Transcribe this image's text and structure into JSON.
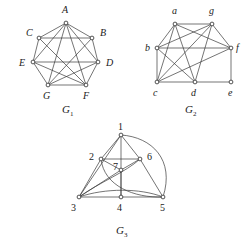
{
  "figure": {
    "background_color": "#ffffff",
    "edge_color": "#3a3a3a",
    "vertex_fill": "#ffffff",
    "vertex_stroke": "#2a2a2a"
  },
  "graphs": [
    {
      "id": "g1",
      "caption_letter": "G",
      "caption_subscript": "1",
      "caption_x": 62,
      "caption_y": 110,
      "label_style": "italic-letters",
      "vertices": [
        {
          "name": "A",
          "x": 66,
          "y": 23,
          "label_x": 62,
          "label_y": 13
        },
        {
          "name": "B",
          "x": 92,
          "y": 38,
          "label_x": 100,
          "label_y": 36
        },
        {
          "name": "C",
          "x": 39,
          "y": 38,
          "label_x": 26,
          "label_y": 36
        },
        {
          "name": "D",
          "x": 98,
          "y": 62,
          "label_x": 106,
          "label_y": 66
        },
        {
          "name": "E",
          "x": 33,
          "y": 62,
          "label_x": 20,
          "label_y": 66
        },
        {
          "name": "F",
          "x": 86,
          "y": 85,
          "label_x": 84,
          "label_y": 99
        },
        {
          "name": "G",
          "x": 48,
          "y": 85,
          "label_x": 43,
          "label_y": 99
        }
      ],
      "edges": [
        [
          "A",
          "B"
        ],
        [
          "A",
          "C"
        ],
        [
          "A",
          "D"
        ],
        [
          "A",
          "E"
        ],
        [
          "A",
          "F"
        ],
        [
          "A",
          "G"
        ],
        [
          "B",
          "C"
        ],
        [
          "B",
          "D"
        ],
        [
          "B",
          "G"
        ],
        [
          "C",
          "E"
        ],
        [
          "C",
          "F"
        ],
        [
          "D",
          "E"
        ],
        [
          "D",
          "F"
        ],
        [
          "D",
          "G"
        ],
        [
          "E",
          "G"
        ],
        [
          "E",
          "F"
        ],
        [
          "F",
          "G"
        ]
      ]
    },
    {
      "id": "g2",
      "caption_letter": "G",
      "caption_subscript": "2",
      "caption_x": 185,
      "caption_y": 110,
      "label_style": "italic-letters",
      "vertices": [
        {
          "name": "a",
          "x": 175,
          "y": 24,
          "label_x": 171,
          "label_y": 13
        },
        {
          "name": "g",
          "x": 212,
          "y": 24,
          "label_x": 209,
          "label_y": 13
        },
        {
          "name": "b",
          "x": 157,
          "y": 48,
          "label_x": 145,
          "label_y": 48
        },
        {
          "name": "f",
          "x": 231,
          "y": 48,
          "label_x": 236,
          "label_y": 48
        },
        {
          "name": "c",
          "x": 157,
          "y": 82,
          "label_x": 153,
          "label_y": 95
        },
        {
          "name": "d",
          "x": 195,
          "y": 82,
          "label_x": 191,
          "label_y": 95
        },
        {
          "name": "e",
          "x": 231,
          "y": 82,
          "label_x": 228,
          "label_y": 95
        }
      ],
      "edges": [
        [
          "a",
          "g"
        ],
        [
          "a",
          "b"
        ],
        [
          "a",
          "f"
        ],
        [
          "a",
          "c"
        ],
        [
          "a",
          "d"
        ],
        [
          "g",
          "b"
        ],
        [
          "g",
          "f"
        ],
        [
          "g",
          "c"
        ],
        [
          "g",
          "d"
        ],
        [
          "b",
          "f"
        ],
        [
          "b",
          "c"
        ],
        [
          "b",
          "d"
        ],
        [
          "f",
          "e"
        ],
        [
          "f",
          "c"
        ],
        [
          "c",
          "d"
        ],
        [
          "d",
          "e"
        ]
      ]
    },
    {
      "id": "g3",
      "caption_letter": "G",
      "caption_subscript": "3",
      "caption_x": 116,
      "caption_y": 231,
      "label_style": "numbers",
      "vertices": [
        {
          "name": "1",
          "x": 121,
          "y": 135,
          "label_x": 118,
          "label_y": 128
        },
        {
          "name": "2",
          "x": 101,
          "y": 159,
          "label_x": 91,
          "label_y": 157
        },
        {
          "name": "6",
          "x": 140,
          "y": 159,
          "label_x": 147,
          "label_y": 157
        },
        {
          "name": "7",
          "x": 121,
          "y": 170,
          "label_x": 114,
          "label_y": 168
        },
        {
          "name": "3",
          "x": 79,
          "y": 197,
          "label_x": 72,
          "label_y": 210
        },
        {
          "name": "4",
          "x": 121,
          "y": 197,
          "label_x": 117,
          "label_y": 210
        },
        {
          "name": "5",
          "x": 163,
          "y": 197,
          "label_x": 160,
          "label_y": 210
        }
      ],
      "straight_edges": [
        [
          "1",
          "2"
        ],
        [
          "1",
          "6"
        ],
        [
          "1",
          "4"
        ],
        [
          "1",
          "3"
        ],
        [
          "2",
          "6"
        ],
        [
          "2",
          "7"
        ],
        [
          "2",
          "3"
        ],
        [
          "6",
          "7"
        ],
        [
          "6",
          "5"
        ],
        [
          "3",
          "4"
        ],
        [
          "4",
          "5"
        ],
        [
          "3",
          "7"
        ],
        [
          "7",
          "4"
        ]
      ],
      "curved_edges": [
        {
          "from": "1",
          "to": "5",
          "label": "outer-right-arc"
        },
        {
          "from": "3",
          "to": "6",
          "label": "lower-arc"
        },
        {
          "from": "2",
          "to": "5",
          "label": "lower-arc"
        },
        {
          "from": "3",
          "to": "5",
          "label": "shallow-arc"
        }
      ]
    }
  ]
}
